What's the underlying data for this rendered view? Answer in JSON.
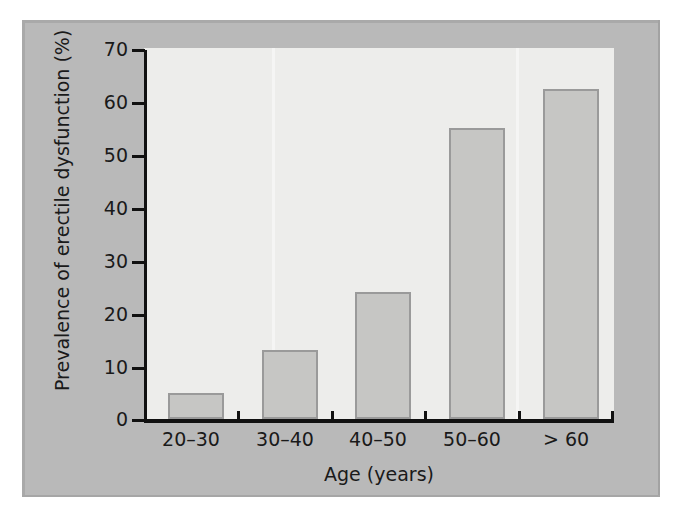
{
  "chart_data": {
    "type": "bar",
    "title": "",
    "xlabel": "Age (years)",
    "ylabel": "Prevalence of erectile dysfunction (%)",
    "categories": [
      "20–30",
      "30–40",
      "40–50",
      "50–60",
      "> 60"
    ],
    "values": [
      5,
      13,
      24,
      55,
      62.5
    ],
    "ylim": [
      0,
      70
    ],
    "yticks": [
      0,
      10,
      20,
      30,
      40,
      50,
      60,
      70
    ],
    "ytick_labels": [
      "0",
      "10",
      "20",
      "30",
      "40",
      "50",
      "60",
      "70"
    ],
    "grid": false,
    "legend": null,
    "series": [
      {
        "name": "Prevalence of erectile dysfunction (%)",
        "values": [
          5,
          13,
          24,
          55,
          62.5
        ]
      }
    ],
    "colors": {
      "bar_fill": "#c6c6c4",
      "bar_border": "#9a9a9a",
      "plot_background": "#ededeb",
      "figure_background": "#b9b9b9",
      "axis": "#111111",
      "text": "#1a1a1a"
    }
  }
}
